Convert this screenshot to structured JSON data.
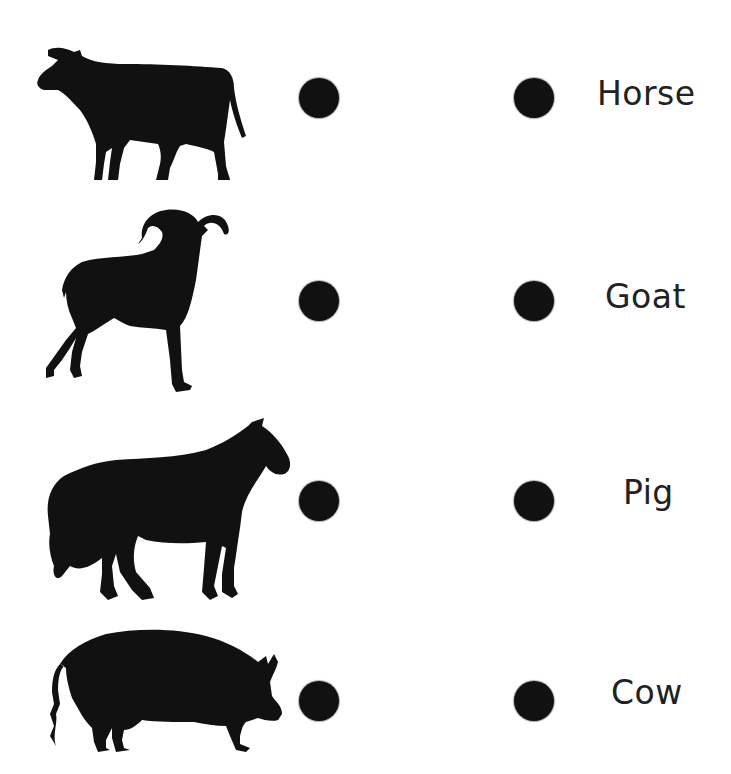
{
  "worksheet": {
    "type": "matching",
    "left_column": [
      {
        "animal": "cow",
        "icon": "cow-silhouette-icon"
      },
      {
        "animal": "goat",
        "icon": "goat-silhouette-icon"
      },
      {
        "animal": "horse",
        "icon": "horse-silhouette-icon"
      },
      {
        "animal": "pig",
        "icon": "pig-silhouette-icon"
      }
    ],
    "right_column": [
      {
        "label": "Horse"
      },
      {
        "label": "Goat"
      },
      {
        "label": "Pig"
      },
      {
        "label": "Cow"
      }
    ],
    "colors": {
      "silhouette": "#111111",
      "dot": "#111111",
      "text": "#222222",
      "background": "#ffffff"
    }
  }
}
